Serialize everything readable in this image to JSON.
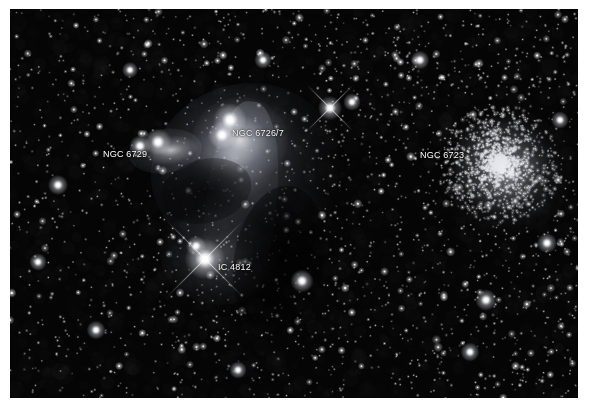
{
  "image": {
    "kind": "astrophotograph",
    "field": "Corona Australis molecular cloud",
    "background_color": "#050505",
    "border_color": "#ffffff",
    "frame": {
      "x": 10,
      "y": 9,
      "width": 568,
      "height": 389
    }
  },
  "labels": [
    {
      "id": "ngc-6729",
      "text": "NGC 6729",
      "x": 93,
      "y": 140,
      "color": "#ffffff"
    },
    {
      "id": "ngc-6726-7",
      "text": "NGC 6726/7",
      "x": 222,
      "y": 119,
      "color": "#ffffff"
    },
    {
      "id": "ic-4812",
      "text": "IC 4812",
      "x": 208,
      "y": 253,
      "color": "#ffffff"
    },
    {
      "id": "ngc-6723",
      "text": "NGC 6723",
      "x": 410,
      "y": 141,
      "color": "#ffffff"
    }
  ],
  "objects": {
    "globular_cluster": {
      "name": "NGC 6723",
      "center_x": 499,
      "center_y": 164,
      "core_radius": 26,
      "halo_radius": 62,
      "member_star_count": 1500
    },
    "reflection_nebula": {
      "name": "NGC 6726/7",
      "center_x": 230,
      "center_y": 131
    },
    "variable_nebula": {
      "name": "NGC 6729",
      "center_x": 155,
      "center_y": 142
    },
    "nebula_ic4812": {
      "name": "IC 4812",
      "center_x": 210,
      "center_y": 246
    }
  },
  "bright_stars": [
    {
      "x": 230,
      "y": 120,
      "radius": 5.0,
      "spikes": 0
    },
    {
      "x": 222,
      "y": 135,
      "radius": 4.2,
      "spikes": 0
    },
    {
      "x": 158,
      "y": 142,
      "radius": 4.0,
      "spikes": 0
    },
    {
      "x": 140,
      "y": 146,
      "radius": 3.2,
      "spikes": 0
    },
    {
      "x": 205,
      "y": 259,
      "radius": 6.0,
      "spikes": 4
    },
    {
      "x": 196,
      "y": 246,
      "radius": 3.0,
      "spikes": 0
    },
    {
      "x": 330,
      "y": 108,
      "radius": 3.6,
      "spikes": 4
    },
    {
      "x": 352,
      "y": 102,
      "radius": 2.6,
      "spikes": 0
    },
    {
      "x": 58,
      "y": 185,
      "radius": 3.0,
      "spikes": 0
    },
    {
      "x": 486,
      "y": 300,
      "radius": 3.2,
      "spikes": 0
    },
    {
      "x": 302,
      "y": 281,
      "radius": 3.4,
      "spikes": 0
    },
    {
      "x": 96,
      "y": 330,
      "radius": 2.8,
      "spikes": 0
    },
    {
      "x": 547,
      "y": 243,
      "radius": 3.0,
      "spikes": 0
    },
    {
      "x": 420,
      "y": 60,
      "radius": 2.8,
      "spikes": 0
    },
    {
      "x": 263,
      "y": 60,
      "radius": 2.6,
      "spikes": 0
    },
    {
      "x": 130,
      "y": 70,
      "radius": 2.4,
      "spikes": 0
    },
    {
      "x": 470,
      "y": 352,
      "radius": 2.8,
      "spikes": 0
    },
    {
      "x": 238,
      "y": 370,
      "radius": 2.6,
      "spikes": 0
    },
    {
      "x": 38,
      "y": 262,
      "radius": 2.6,
      "spikes": 0
    },
    {
      "x": 560,
      "y": 120,
      "radius": 2.6,
      "spikes": 0
    }
  ],
  "starfield": {
    "faint_star_count": 2600,
    "mid_star_count": 420,
    "seed": 20240617
  }
}
